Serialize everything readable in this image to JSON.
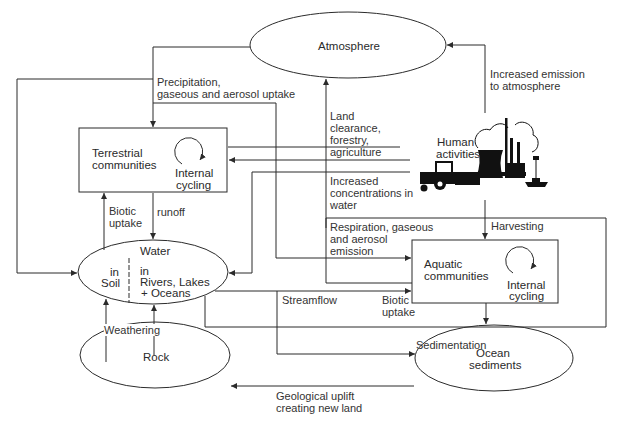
{
  "nodes": {
    "atmosphere": {
      "label": "Atmosphere"
    },
    "terrestrial": {
      "label_line1": "Terrestrial",
      "label_line2": "communities",
      "cycle_line1": "Internal",
      "cycle_line2": "cycling"
    },
    "water": {
      "title": "Water",
      "soil_line1": "in",
      "soil_line2": "Soil",
      "rivers_line1": "in",
      "rivers_line2": "Rivers, Lakes",
      "rivers_line3": "+ Oceans"
    },
    "rock": {
      "label": "Rock"
    },
    "ocean_sediments": {
      "label_line1": "Ocean",
      "label_line2": "sediments"
    },
    "aquatic": {
      "label_line1": "Aquatic",
      "label_line2": "communities",
      "cycle_line1": "Internal",
      "cycle_line2": "cycling"
    },
    "human": {
      "label_line1": "Human",
      "label_line2": "activities"
    }
  },
  "flows": {
    "precipitation": {
      "line1": "Precipitation,",
      "line2": "gaseous and aerosol uptake"
    },
    "increased_emission": {
      "line1": "Increased emission",
      "line2": "to atmosphere"
    },
    "land_clearance": {
      "line1": "Land",
      "line2": "clearance,",
      "line3": "forestry,",
      "line4": "agriculture"
    },
    "increased_concentrations": {
      "line1": "Increased",
      "line2": "concentrations in",
      "line3": "water"
    },
    "respiration": {
      "line1": "Respiration, gaseous",
      "line2": "and aerosol",
      "line3": "emission"
    },
    "harvesting": {
      "label": "Harvesting"
    },
    "biotic_uptake_terrestrial": {
      "line1": "Biotic",
      "line2": "uptake"
    },
    "runoff": {
      "label": "runoff"
    },
    "streamflow": {
      "label": "Streamflow"
    },
    "biotic_uptake_aquatic": {
      "line1": "Biotic",
      "line2": "uptake"
    },
    "sedimentation": {
      "label": "Sedimentation"
    },
    "weathering": {
      "label": "Weathering"
    },
    "geological_uplift": {
      "line1": "Geological uplift",
      "line2": "creating new land"
    }
  },
  "colors": {
    "line": "#2b2b2b",
    "text": "#333333",
    "background": "#ffffff"
  }
}
